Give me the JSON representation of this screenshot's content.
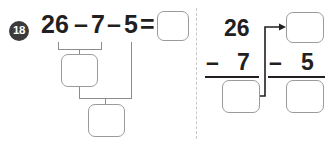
{
  "problem": {
    "number": "18",
    "type": "subtract-in-steps"
  },
  "left": {
    "expression": {
      "first_number": "26",
      "operator_1": "–",
      "second_number": "7",
      "operator_2": "–",
      "third_number": "5",
      "equals": "="
    },
    "answer_boxes": {
      "final_result": "",
      "step_1_result": "",
      "step_2_result": ""
    }
  },
  "right": {
    "column_1": {
      "minuend": "26",
      "operator": "–",
      "subtrahend": "7",
      "difference": ""
    },
    "column_2": {
      "minuend": "",
      "operator": "–",
      "subtrahend": "5",
      "difference": ""
    }
  },
  "colors": {
    "badge_fill": "#3b3b3b",
    "badge_text": "#ffffff",
    "text": "#231f20",
    "box_border": "#9b9b9b",
    "connector": "#8c8c8c",
    "divider": "#c8c8c8",
    "rule": "#231f20",
    "background": "#ffffff"
  }
}
